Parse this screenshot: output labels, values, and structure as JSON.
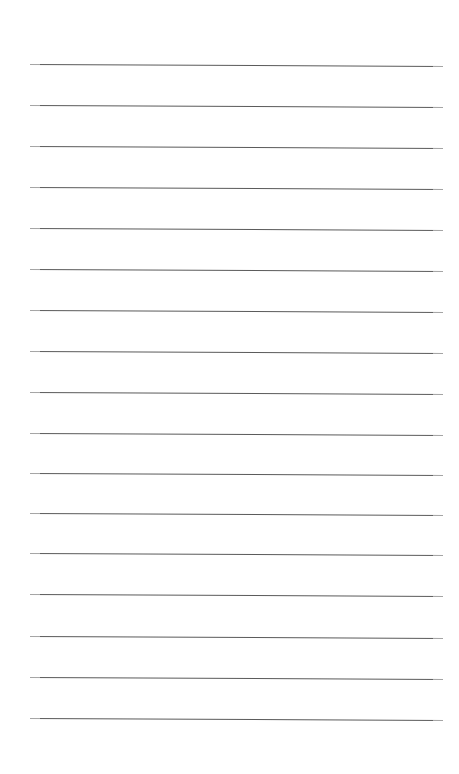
{
  "document": {
    "kind": "lined-paper",
    "title": "Blank Lined Notebook Page",
    "page_width": 459,
    "page_height": 774,
    "background_color": "#ffffff",
    "content_text": "",
    "margins": {
      "left": 30,
      "right": 16,
      "top": 64,
      "bottom": 56
    },
    "rule_style": {
      "color": "#5a5a5a",
      "thickness": 1,
      "left_x": 30,
      "right_x": 443,
      "length": 413,
      "slant_degrees": 0.28,
      "spacing": 41,
      "count": 17
    },
    "rules": [
      {
        "index": 1,
        "y": 64
      },
      {
        "index": 2,
        "y": 105
      },
      {
        "index": 3,
        "y": 146
      },
      {
        "index": 4,
        "y": 187
      },
      {
        "index": 5,
        "y": 228
      },
      {
        "index": 6,
        "y": 269
      },
      {
        "index": 7,
        "y": 310
      },
      {
        "index": 8,
        "y": 351
      },
      {
        "index": 9,
        "y": 392
      },
      {
        "index": 10,
        "y": 433
      },
      {
        "index": 11,
        "y": 473
      },
      {
        "index": 12,
        "y": 513
      },
      {
        "index": 13,
        "y": 553
      },
      {
        "index": 14,
        "y": 594
      },
      {
        "index": 15,
        "y": 636
      },
      {
        "index": 16,
        "y": 677
      },
      {
        "index": 17,
        "y": 718
      }
    ]
  }
}
